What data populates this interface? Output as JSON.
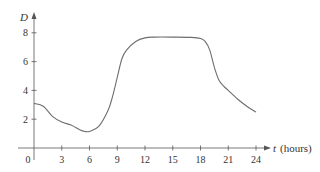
{
  "chart_data": {
    "type": "line",
    "title": "",
    "xlabel": "t (hours)",
    "xlabel_var": "t",
    "xlabel_unit": "(hours)",
    "ylabel": "D",
    "xlim": [
      0,
      25
    ],
    "ylim": [
      0,
      9
    ],
    "x_ticks": [
      0,
      3,
      6,
      9,
      12,
      15,
      18,
      21,
      24
    ],
    "x_tick_labels": [
      "0",
      "3",
      "6",
      "9",
      "12",
      "15",
      "18",
      "21",
      "24"
    ],
    "y_ticks": [
      2,
      4,
      6,
      8
    ],
    "y_tick_labels": [
      "2",
      "4",
      "6",
      "8"
    ],
    "grid": false,
    "legend": null,
    "series": [
      {
        "name": "D",
        "x": [
          0,
          1,
          2,
          3,
          4,
          5,
          5.5,
          6,
          7,
          8,
          8.5,
          9,
          9.5,
          10,
          11,
          12,
          13,
          15,
          17,
          18,
          18.5,
          19,
          19.5,
          20,
          20.5,
          21,
          22,
          23,
          24
        ],
        "y": [
          3.1,
          2.9,
          2.2,
          1.8,
          1.6,
          1.25,
          1.15,
          1.15,
          1.5,
          2.6,
          3.6,
          4.9,
          6.2,
          6.8,
          7.4,
          7.65,
          7.7,
          7.7,
          7.68,
          7.6,
          7.4,
          6.8,
          5.6,
          4.7,
          4.3,
          4.0,
          3.4,
          2.9,
          2.5
        ]
      }
    ]
  },
  "colors": {
    "line": "#6e6e6e",
    "axis": "#555555",
    "text": "#333333",
    "background": "#ffffff"
  }
}
